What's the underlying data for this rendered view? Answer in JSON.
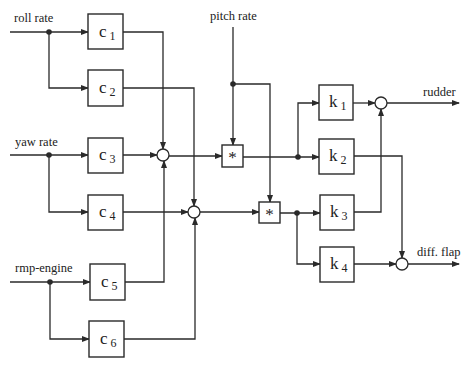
{
  "inputs": {
    "roll_rate": "roll rate",
    "yaw_rate": "yaw rate",
    "rmp_engine": "rmp-engine",
    "pitch_rate": "pitch rate"
  },
  "outputs": {
    "rudder": "rudder",
    "diff_flap": "diff. flap"
  },
  "gain_blocks": [
    {
      "base": "c",
      "sub": "1"
    },
    {
      "base": "c",
      "sub": "2"
    },
    {
      "base": "c",
      "sub": "3"
    },
    {
      "base": "c",
      "sub": "4"
    },
    {
      "base": "c",
      "sub": "5"
    },
    {
      "base": "c",
      "sub": "6"
    }
  ],
  "output_blocks": [
    {
      "base": "k",
      "sub": "1"
    },
    {
      "base": "k",
      "sub": "2"
    },
    {
      "base": "k",
      "sub": "3"
    },
    {
      "base": "k",
      "sub": "4"
    }
  ],
  "multipliers": [
    {
      "symbol": "*"
    },
    {
      "symbol": "*"
    }
  ],
  "colors": {
    "line": "#2a2a2a",
    "background": "#ffffff"
  }
}
